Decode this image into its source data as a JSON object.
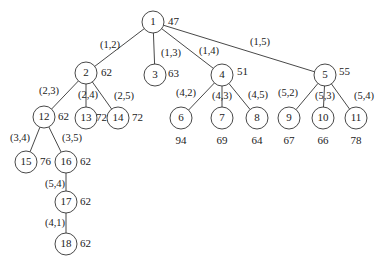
{
  "diagram": {
    "type": "tree",
    "nodes": [
      {
        "id": "1",
        "x": 153,
        "y": 22,
        "value": "47",
        "vx": 168,
        "vy": 22,
        "anchor": "start"
      },
      {
        "id": "2",
        "x": 86,
        "y": 73,
        "value": "62",
        "vx": 101,
        "vy": 73,
        "anchor": "start"
      },
      {
        "id": "3",
        "x": 155,
        "y": 75,
        "value": "63",
        "vx": 168,
        "vy": 74,
        "anchor": "start"
      },
      {
        "id": "4",
        "x": 222,
        "y": 75,
        "value": "51",
        "vx": 237,
        "vy": 72,
        "anchor": "start"
      },
      {
        "id": "5",
        "x": 325,
        "y": 75,
        "value": "55",
        "vx": 339,
        "vy": 72,
        "anchor": "start"
      },
      {
        "id": "12",
        "x": 44,
        "y": 117,
        "value": "62",
        "vx": 58,
        "vy": 117,
        "anchor": "start"
      },
      {
        "id": "13",
        "x": 86,
        "y": 118,
        "value": "72",
        "vx": 96,
        "vy": 118,
        "anchor": "start"
      },
      {
        "id": "14",
        "x": 118,
        "y": 118,
        "value": "72",
        "vx": 132,
        "vy": 118,
        "anchor": "start"
      },
      {
        "id": "6",
        "x": 181,
        "y": 118,
        "value": "94",
        "vx": 181,
        "vy": 141,
        "anchor": "middle"
      },
      {
        "id": "7",
        "x": 222,
        "y": 118,
        "value": "69",
        "vx": 222,
        "vy": 141,
        "anchor": "middle"
      },
      {
        "id": "8",
        "x": 257,
        "y": 118,
        "value": "64",
        "vx": 257,
        "vy": 141,
        "anchor": "middle"
      },
      {
        "id": "9",
        "x": 289,
        "y": 118,
        "value": "67",
        "vx": 289,
        "vy": 141,
        "anchor": "middle"
      },
      {
        "id": "10",
        "x": 323,
        "y": 118,
        "value": "66",
        "vx": 323,
        "vy": 141,
        "anchor": "middle"
      },
      {
        "id": "11",
        "x": 356,
        "y": 118,
        "value": "78",
        "vx": 356,
        "vy": 141,
        "anchor": "middle"
      },
      {
        "id": "15",
        "x": 26,
        "y": 162,
        "value": "76",
        "vx": 40,
        "vy": 162,
        "anchor": "start"
      },
      {
        "id": "16",
        "x": 66,
        "y": 162,
        "value": "62",
        "vx": 80,
        "vy": 162,
        "anchor": "start"
      },
      {
        "id": "17",
        "x": 66,
        "y": 202,
        "value": "62",
        "vx": 80,
        "vy": 202,
        "anchor": "start"
      },
      {
        "id": "18",
        "x": 66,
        "y": 244,
        "value": "62",
        "vx": 80,
        "vy": 244,
        "anchor": "start"
      }
    ],
    "edges": [
      {
        "from": "1",
        "to": "2",
        "label": "(1,2)",
        "lx": 110,
        "ly": 46
      },
      {
        "from": "1",
        "to": "3",
        "label": "(1,3)",
        "lx": 171,
        "ly": 54
      },
      {
        "from": "1",
        "to": "4",
        "label": "(1,4)",
        "lx": 209,
        "ly": 52
      },
      {
        "from": "1",
        "to": "5",
        "label": "(1,5)",
        "lx": 260,
        "ly": 43
      },
      {
        "from": "2",
        "to": "12",
        "label": "(2,3)",
        "lx": 49,
        "ly": 92
      },
      {
        "from": "2",
        "to": "13",
        "label": "(2,4)",
        "lx": 88,
        "ly": 96
      },
      {
        "from": "2",
        "to": "14",
        "label": "(2,5)",
        "lx": 124,
        "ly": 97
      },
      {
        "from": "12",
        "to": "15",
        "label": "(3,4)",
        "lx": 20,
        "ly": 139
      },
      {
        "from": "12",
        "to": "16",
        "label": "(3,5)",
        "lx": 72,
        "ly": 139
      },
      {
        "from": "16",
        "to": "17",
        "label": "(5,4)",
        "lx": 55,
        "ly": 185
      },
      {
        "from": "17",
        "to": "18",
        "label": "(4,1)",
        "lx": 55,
        "ly": 224
      },
      {
        "from": "4",
        "to": "6",
        "label": "(4,2)",
        "lx": 186,
        "ly": 94
      },
      {
        "from": "4",
        "to": "7",
        "label": "(4,3)",
        "lx": 222,
        "ly": 97
      },
      {
        "from": "4",
        "to": "8",
        "label": "(4,5)",
        "lx": 258,
        "ly": 96
      },
      {
        "from": "5",
        "to": "9",
        "label": "(5,2)",
        "lx": 288,
        "ly": 94
      },
      {
        "from": "5",
        "to": "10",
        "label": "(5,3)",
        "lx": 325,
        "ly": 97
      },
      {
        "from": "5",
        "to": "11",
        "label": "(5,4)",
        "lx": 364,
        "ly": 97
      }
    ],
    "node_radius": 11
  }
}
